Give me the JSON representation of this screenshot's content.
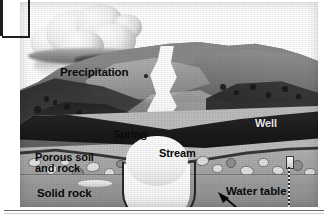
{
  "labels": {
    "precipitation": "Precipitation",
    "spring": "Spring",
    "stream": "Stream",
    "well": "Well",
    "porous_soil_and_rock": "Porous soil\nand rock",
    "solid_rock": "Solid rock",
    "water_table": "Water table"
  },
  "icons": {
    "cloud": "cloud-icon",
    "well_shaft": "well-shaft-icon",
    "arrow": "arrow-icon"
  },
  "colors": {
    "page_background": "#ffffff",
    "ink": "#0a0a0a",
    "terrain_dark": "#2a2a2a",
    "terrain_mid": "#6d6d6d",
    "terrain_light": "#b9b9b9",
    "aquifer": "#ababab",
    "bedrock": "#9a9a9a",
    "water": "#ffffff",
    "rule": "#6e6e6e"
  }
}
